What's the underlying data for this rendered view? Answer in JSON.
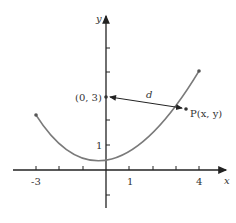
{
  "diagram": {
    "axes": {
      "x_label": "x",
      "y_label": "y"
    },
    "x_ticks": [
      {
        "value": -3,
        "label": "-3"
      },
      {
        "value": 1,
        "label": "1"
      },
      {
        "value": 4,
        "label": "4"
      }
    ],
    "y_ticks": [
      {
        "value": 1,
        "label": "1"
      }
    ],
    "curve": {
      "equation": "y = x^2/4",
      "domain": [
        -3,
        4
      ]
    },
    "focus_point": {
      "label": "(0, 3)"
    },
    "point_p": {
      "label": "P(x, y)"
    },
    "distance": {
      "label": "d"
    },
    "colors": {
      "curve": "#7a7a7a",
      "axis": "#222222",
      "text": "#333333"
    }
  }
}
